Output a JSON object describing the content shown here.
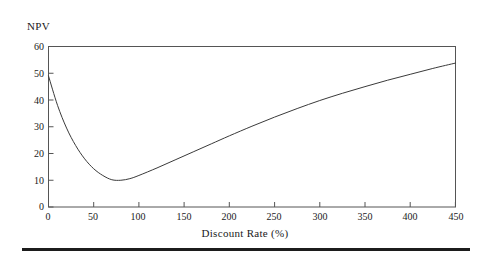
{
  "figure": {
    "background_color": "#ffffff",
    "line_color": "#3a3a3a",
    "axis_color": "#555555",
    "text_color": "#1a1a1a",
    "rule_color": "#1c1c1c"
  },
  "labels": {
    "y_axis_name": "NPV",
    "x_axis_title": "Discount Rate (%)"
  },
  "chart_data": {
    "type": "line",
    "title": "",
    "xlabel": "Discount Rate (%)",
    "ylabel": "NPV",
    "xlim": [
      0,
      450
    ],
    "ylim": [
      0,
      60
    ],
    "xticks": [
      0,
      50,
      100,
      150,
      200,
      250,
      300,
      350,
      400,
      450
    ],
    "yticks": [
      0,
      10,
      20,
      30,
      40,
      50,
      60
    ],
    "xtick_labels": [
      "0",
      "50",
      "100",
      "150",
      "200",
      "250",
      "300",
      "350",
      "400",
      "450"
    ],
    "ytick_labels": [
      "0",
      "10",
      "20",
      "30",
      "40",
      "50",
      "60"
    ],
    "grid": false,
    "legend": false,
    "legend_position": "none",
    "series": [
      {
        "name": "NPV",
        "x": [
          0,
          10,
          20,
          30,
          40,
          50,
          60,
          70,
          80,
          90,
          100,
          120,
          140,
          160,
          180,
          200,
          225,
          250,
          275,
          300,
          325,
          350,
          375,
          400,
          425,
          450
        ],
        "y": [
          49.0,
          38.0,
          29.5,
          23.0,
          18.0,
          14.3,
          11.8,
          10.2,
          10.0,
          10.6,
          11.8,
          14.6,
          17.6,
          20.6,
          23.6,
          26.6,
          30.2,
          33.6,
          36.8,
          39.8,
          42.5,
          45.0,
          47.4,
          49.6,
          51.8,
          53.8
        ]
      }
    ],
    "annotations": {
      "minimum_point": {
        "x": 75,
        "y": 10.0
      },
      "start_point": {
        "x": 0,
        "y": 49.0
      },
      "end_point": {
        "x": 450,
        "y": 53.8
      }
    }
  }
}
